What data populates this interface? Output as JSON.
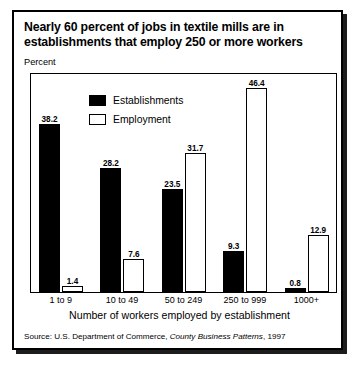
{
  "title": "Nearly 60 percent of jobs in textile mills are in establishments that employ 250 or more workers",
  "percent_label": "Percent",
  "legend": [
    {
      "label": "Establishments",
      "swatch": "filled",
      "color": "#000000"
    },
    {
      "label": "Employment",
      "swatch": "hollow",
      "color": "#ffffff"
    }
  ],
  "xaxis_title": "Number of workers employed by establishment",
  "source": {
    "prefix": "Source: U.S. Department of Commerce, ",
    "italic": "County Business Patterns",
    "suffix": ", 1997"
  },
  "chart_data": {
    "type": "bar",
    "title": "Nearly 60 percent of jobs in textile mills are in establishments that employ 250 or more workers",
    "subtitle": "",
    "xlabel": "Number of workers employed by establishment",
    "ylabel": "Percent",
    "ylim": [
      0,
      50
    ],
    "grid": false,
    "legend_position": "top-left-inside",
    "categories": [
      "1 to 9",
      "10 to 49",
      "50 to 249",
      "250 to 999",
      "1000+"
    ],
    "series": [
      {
        "name": "Establishments",
        "color": "#000000",
        "values": [
          38.2,
          28.2,
          23.5,
          9.3,
          0.8
        ]
      },
      {
        "name": "Employment",
        "color": "#ffffff",
        "values": [
          1.4,
          7.6,
          31.7,
          46.4,
          12.9
        ]
      }
    ],
    "data_labels": true,
    "source": "Source: U.S. Department of Commerce, County Business Patterns, 1997"
  }
}
